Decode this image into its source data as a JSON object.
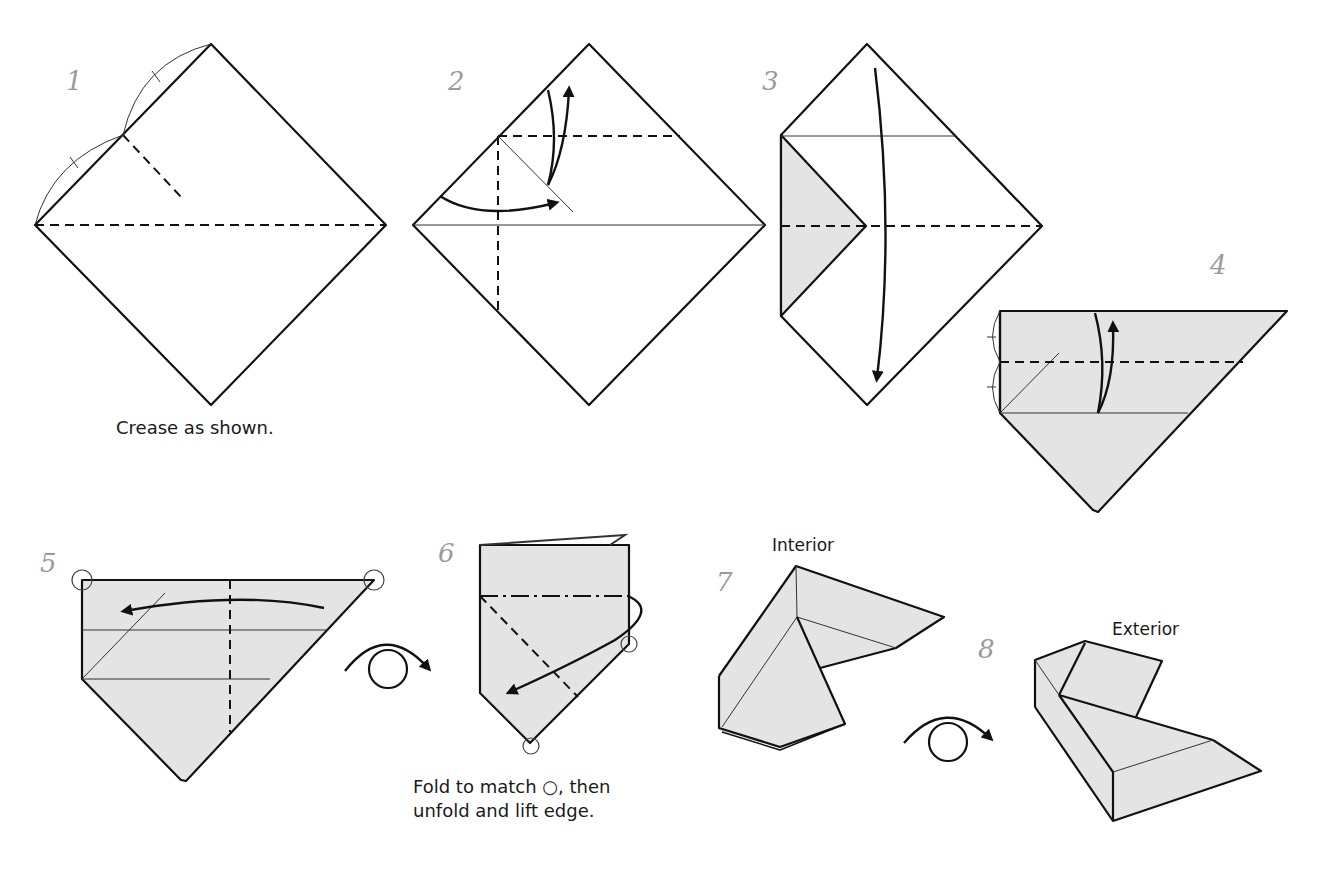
{
  "diagram": {
    "colors": {
      "line": "#111111",
      "paper_colored_side": "#e4e4e4",
      "paper_white_side": "#ffffff",
      "step_number": "#9a9a9a"
    },
    "steps": [
      {
        "number": "1",
        "caption": "Crease as shown."
      },
      {
        "number": "2"
      },
      {
        "number": "3"
      },
      {
        "number": "4"
      },
      {
        "number": "5"
      },
      {
        "number": "6",
        "caption_line1": "Fold to match ○, then",
        "caption_line2": "unfold and lift edge."
      },
      {
        "number": "7",
        "label": "Interior"
      },
      {
        "number": "8",
        "label": "Exterior"
      }
    ],
    "symbols": {
      "valley_fold": "dashed-line",
      "mountain_fold": "dash-dot-line",
      "turn_over": "turn-over-arrow",
      "match_point": "circle-marker"
    }
  }
}
